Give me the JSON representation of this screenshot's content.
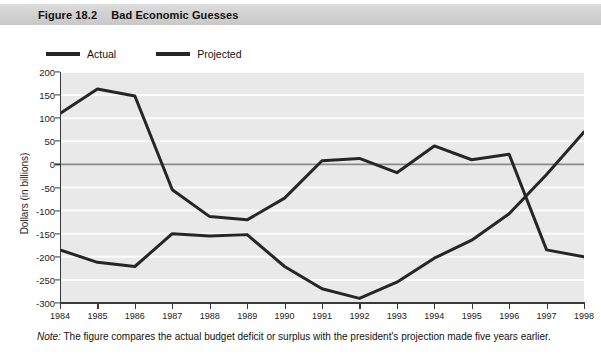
{
  "figure": {
    "number": "Figure 18.2",
    "title": "Bad Economic Guesses",
    "note_prefix": "Note:",
    "note_text": " The figure compares the actual budget deficit or surplus with the president's projection made five years earlier."
  },
  "legend": {
    "position": "top-left",
    "items": [
      {
        "label": "Actual",
        "color": "#262626"
      },
      {
        "label": "Projected",
        "color": "#262626"
      }
    ]
  },
  "chart_data": {
    "type": "line",
    "title": "Bad Economic Guesses",
    "xlabel": "",
    "ylabel": "Dollars (in billions)",
    "x": [
      1984,
      1985,
      1986,
      1987,
      1988,
      1989,
      1990,
      1991,
      1992,
      1993,
      1994,
      1995,
      1996,
      1997,
      1998
    ],
    "xtick_labels": [
      "1984",
      "1985",
      "1986",
      "1987",
      "1988",
      "1989",
      "1990",
      "1991",
      "1992",
      "1993",
      "1994",
      "1995",
      "1996",
      "1997",
      "1998"
    ],
    "ytick_labels": [
      "200",
      "150",
      "100",
      "50",
      "0",
      "-50",
      "-100",
      "-150",
      "-200",
      "-250",
      "-300"
    ],
    "ytick_values": [
      200,
      150,
      100,
      50,
      0,
      -50,
      -100,
      -150,
      -200,
      -250,
      -300
    ],
    "ylim": [
      -300,
      200
    ],
    "xlim": [
      1984,
      1998
    ],
    "grid": true,
    "grid_axis": "y",
    "zero_line": true,
    "series": [
      {
        "name": "Actual",
        "color": "#262626",
        "values": [
          -185,
          -212,
          -221,
          -150,
          -155,
          -152,
          -221,
          -269,
          -290,
          -255,
          -203,
          -164,
          -107,
          -22,
          70
        ]
      },
      {
        "name": "Projected",
        "color": "#262626",
        "values": [
          110,
          163,
          148,
          -55,
          -113,
          -120,
          -73,
          8,
          13,
          -18,
          40,
          10,
          22,
          -185,
          -200
        ]
      }
    ]
  }
}
